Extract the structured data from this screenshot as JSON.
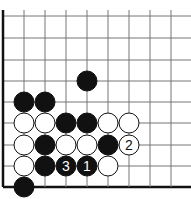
{
  "diagram": {
    "type": "go-board-fragment",
    "grid": {
      "x_lines": [
        3,
        24,
        45,
        66,
        87,
        108,
        129,
        150,
        171
      ],
      "y_lines": [
        16,
        38,
        60,
        81,
        102,
        123,
        145,
        166,
        187
      ],
      "left_edge_thick": true,
      "bottom_edge_thick": true,
      "line_color": "#777777",
      "edge_color": "#111111"
    },
    "stones": [
      {
        "color": "black",
        "col": 4,
        "row": 3,
        "label": ""
      },
      {
        "color": "black",
        "col": 1,
        "row": 4,
        "label": ""
      },
      {
        "color": "black",
        "col": 2,
        "row": 4,
        "label": ""
      },
      {
        "color": "white",
        "col": 1,
        "row": 5,
        "label": ""
      },
      {
        "color": "white",
        "col": 2,
        "row": 5,
        "label": ""
      },
      {
        "color": "black",
        "col": 3,
        "row": 5,
        "label": ""
      },
      {
        "color": "black",
        "col": 4,
        "row": 5,
        "label": ""
      },
      {
        "color": "white",
        "col": 5,
        "row": 5,
        "label": ""
      },
      {
        "color": "white",
        "col": 6,
        "row": 5,
        "label": ""
      },
      {
        "color": "white",
        "col": 1,
        "row": 6,
        "label": ""
      },
      {
        "color": "black",
        "col": 2,
        "row": 6,
        "label": ""
      },
      {
        "color": "white",
        "col": 3,
        "row": 6,
        "label": ""
      },
      {
        "color": "white",
        "col": 4,
        "row": 6,
        "label": ""
      },
      {
        "color": "black",
        "col": 5,
        "row": 6,
        "label": ""
      },
      {
        "color": "white",
        "col": 6,
        "row": 6,
        "label": "2"
      },
      {
        "color": "white",
        "col": 1,
        "row": 7,
        "label": ""
      },
      {
        "color": "black",
        "col": 2,
        "row": 7,
        "label": ""
      },
      {
        "color": "black",
        "col": 3,
        "row": 7,
        "label": "3"
      },
      {
        "color": "black",
        "col": 4,
        "row": 7,
        "label": "1"
      },
      {
        "color": "white",
        "col": 5,
        "row": 7,
        "label": ""
      },
      {
        "color": "black",
        "col": 1,
        "row": 8,
        "label": ""
      }
    ],
    "stone_radius": 10
  }
}
